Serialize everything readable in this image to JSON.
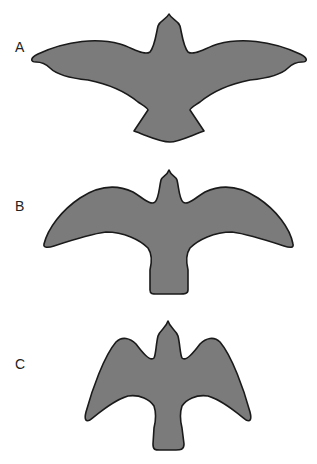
{
  "figure": {
    "panels": [
      {
        "label": "A",
        "shape": "bird-silhouette-long-pointed-wings",
        "fill": "#7b7b7b"
      },
      {
        "label": "B",
        "shape": "bird-silhouette-broad-swept-wings",
        "fill": "#7b7b7b"
      },
      {
        "label": "C",
        "shape": "bird-silhouette-raised-wings",
        "fill": "#7b7b7b"
      }
    ],
    "colors": {
      "fill": "#7b7b7b",
      "outline": "#1a1a1a",
      "background": "#ffffff"
    }
  }
}
